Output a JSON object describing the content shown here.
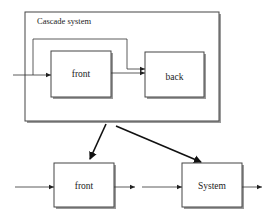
{
  "diagram": {
    "container": {
      "label": "Cascade system"
    },
    "inner_blocks": [
      {
        "id": "front",
        "label": "front"
      },
      {
        "id": "back",
        "label": "back"
      }
    ],
    "outer_blocks": [
      {
        "id": "front",
        "label": "front"
      },
      {
        "id": "system",
        "label": "System"
      }
    ],
    "colors": {
      "line": "#222222",
      "shadow": "#8a8a8a",
      "background": "#ffffff"
    }
  }
}
